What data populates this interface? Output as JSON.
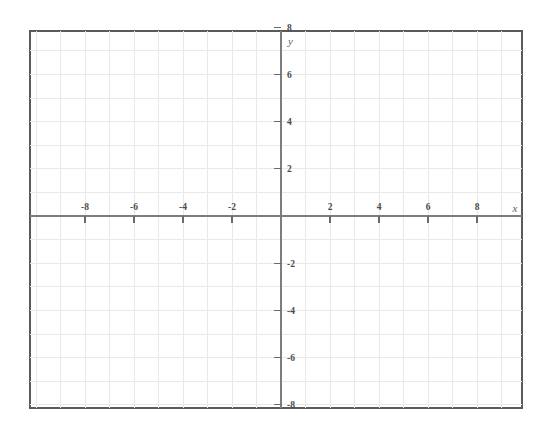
{
  "figure": {
    "kind": "cartesian-coordinate-grid",
    "title": "",
    "background_color": "#ffffff",
    "border_color": "#5a5a5a",
    "grid_color": "#e9e9e9",
    "axis_color": "#7d7d7d",
    "label_color": "#4a4a4a"
  },
  "plot_area": {
    "left_px": 30,
    "top_px": 31,
    "right_px": 522,
    "bottom_px": 408,
    "origin_x_px": 281,
    "origin_y_px": 216,
    "unit_x_px": 24.5,
    "unit_y_px": 23.6
  },
  "chart_data": {
    "type": "scatter",
    "title": "",
    "xlabel": "x",
    "ylabel": "y",
    "xlim": [
      -10,
      10
    ],
    "ylim": [
      -8,
      8
    ],
    "grid": true,
    "grid_step": 1,
    "tick_step": 2,
    "legend": "none",
    "series": [
      {
        "name": "empty",
        "x": [],
        "y": []
      }
    ],
    "x_tick_values": [
      -8,
      -6,
      -4,
      -2,
      2,
      4,
      6,
      8
    ],
    "x_tick_labels": [
      "-8",
      "-6",
      "-4",
      "-2",
      "2",
      "4",
      "6",
      "8"
    ],
    "y_tick_values": [
      8,
      6,
      4,
      2,
      -2,
      -4,
      -6,
      -8
    ],
    "y_tick_labels": [
      "8",
      "6",
      "4",
      "2",
      "-2",
      "-4",
      "-6",
      "-8"
    ],
    "annotations": [],
    "data_points": []
  },
  "labels": {
    "x_axis_name": "x",
    "y_axis_name": "y"
  }
}
